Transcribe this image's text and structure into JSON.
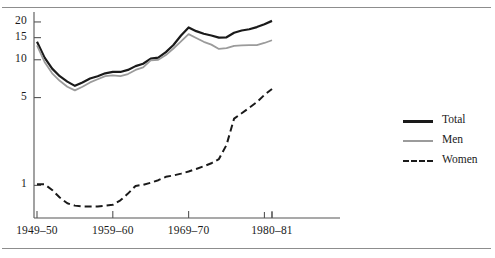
{
  "figure": {
    "background": "#ffffff",
    "rule_color": "#8d8d8d",
    "axis_color": "#555555"
  },
  "chart_data": {
    "type": "line",
    "title": "",
    "subtitle": "",
    "xlabel": "",
    "ylabel": "",
    "scale": "log",
    "grid": false,
    "legend_position": "right",
    "ylim": [
      0.55,
      24
    ],
    "ytick_labels": [
      "20",
      "15",
      "10",
      "5",
      "1"
    ],
    "ytick_values": [
      20,
      15,
      10,
      5,
      1
    ],
    "xtick_labels": [
      "1949–50",
      "1959–60",
      "1969–70",
      "1980–81"
    ],
    "xtick_values": [
      1949,
      1959,
      1969,
      1980
    ],
    "extra_xtick_values": [
      1979,
      1980
    ],
    "x": [
      1949,
      1950,
      1951,
      1952,
      1953,
      1954,
      1955,
      1956,
      1957,
      1958,
      1959,
      1960,
      1961,
      1962,
      1963,
      1964,
      1965,
      1966,
      1967,
      1968,
      1969,
      1970,
      1971,
      1972,
      1973,
      1974,
      1975,
      1976,
      1977,
      1978,
      1979,
      1980
    ],
    "series": [
      {
        "name": "Total",
        "color": "#1a1a1a",
        "style": "solid",
        "width": 2.2,
        "values": [
          13.9,
          10.4,
          8.5,
          7.4,
          6.7,
          6.2,
          6.6,
          7.1,
          7.4,
          7.8,
          8.0,
          8.0,
          8.3,
          8.9,
          9.3,
          10.2,
          10.4,
          11.5,
          13.1,
          15.6,
          18.1,
          16.9,
          16.1,
          15.6,
          15.0,
          15.1,
          16.4,
          17.1,
          17.5,
          18.2,
          19.2,
          20.4
        ]
      },
      {
        "name": "Men",
        "color": "#9b9b9b",
        "style": "solid",
        "width": 1.8,
        "values": [
          13.0,
          9.6,
          7.8,
          6.8,
          6.1,
          5.7,
          6.1,
          6.6,
          7.0,
          7.4,
          7.5,
          7.4,
          7.7,
          8.3,
          8.7,
          9.9,
          10.0,
          10.9,
          12.3,
          14.0,
          16.0,
          14.9,
          13.9,
          13.2,
          12.2,
          12.4,
          12.9,
          13.0,
          13.1,
          13.1,
          13.6,
          14.3
        ]
      },
      {
        "name": "Women",
        "color": "#1a1a1a",
        "style": "dashed",
        "width": 2.0,
        "values": [
          1.02,
          1.02,
          0.92,
          0.8,
          0.72,
          0.69,
          0.68,
          0.68,
          0.68,
          0.69,
          0.7,
          0.76,
          0.86,
          0.99,
          1.01,
          1.05,
          1.1,
          1.17,
          1.2,
          1.24,
          1.29,
          1.35,
          1.42,
          1.5,
          1.62,
          2.1,
          3.4,
          3.75,
          4.15,
          4.6,
          5.25,
          5.85
        ]
      }
    ]
  },
  "legend": {
    "items": [
      {
        "label": "Total",
        "color": "#1a1a1a",
        "style": "solid",
        "thickness": 3
      },
      {
        "label": "Men",
        "color": "#9b9b9b",
        "style": "solid",
        "thickness": 2
      },
      {
        "label": "Women",
        "color": "#1a1a1a",
        "style": "dashed",
        "thickness": 2
      }
    ]
  }
}
